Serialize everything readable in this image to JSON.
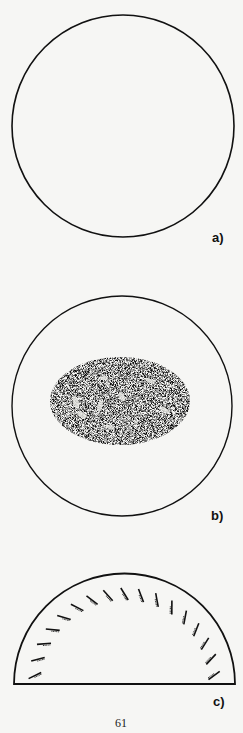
{
  "page": {
    "number": "61",
    "background": "#f6f6f4",
    "ink": "#111111"
  },
  "figures": [
    {
      "id": "a",
      "label": "a)",
      "shape": "circle",
      "content": "empty"
    },
    {
      "id": "b",
      "label": "b)",
      "shape": "circle",
      "content": "dark stippled oval with light patches"
    },
    {
      "id": "c",
      "label": "c)",
      "shape": "semicircle",
      "content": "radial hatch marks with small stipple along inner arc",
      "tick_count": 17
    }
  ]
}
